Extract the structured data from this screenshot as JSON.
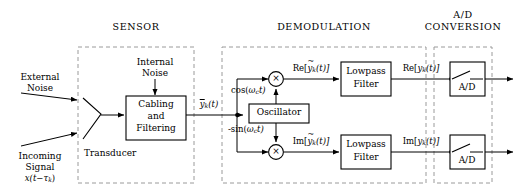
{
  "diagram": {
    "sections": [
      {
        "id": "sensor",
        "label": "SENSOR"
      },
      {
        "id": "demodulation",
        "label": "DEMODULATION"
      },
      {
        "id": "ad_conversion",
        "label": "A/D\nCONVERSION",
        "label_line1": "A/D",
        "label_line2": "CONVERSION"
      }
    ],
    "inputs": {
      "external_noise_line1": "External",
      "external_noise_line2": "Noise",
      "incoming_signal_line1": "Incoming",
      "incoming_signal_line2": "Signal",
      "incoming_signal_math_prefix": "x(t",
      "incoming_signal_math_minus": "−",
      "incoming_signal_math_tau": "τ",
      "incoming_signal_math_sub": "k",
      "incoming_signal_math_suffix": ")",
      "internal_noise_line1": "Internal",
      "internal_noise_line2": "Noise"
    },
    "blocks": {
      "transducer_label": "Transducer",
      "cabling_line1": "Cabling",
      "cabling_line2": "and",
      "cabling_line3": "Filtering",
      "oscillator_label": "Oscillator",
      "lowpass_line1": "Lowpass",
      "lowpass_line2": "Filter",
      "ad_label": "A/D",
      "multiplier_glyph": "×"
    },
    "signals": {
      "sensor_out_base": "y",
      "sensor_out_sub": "k",
      "sensor_out_suffix": "(t)",
      "cos_label_prefix": "cos(",
      "cos_label_omega": "ω",
      "cos_label_sub": "c",
      "cos_label_suffix": "t)",
      "sin_label_prefix": "-sin(",
      "sin_label_omega": "ω",
      "sin_label_sub": "c",
      "sin_label_suffix": "t)",
      "re_tilde_prefix": "Re[",
      "re_tilde_base": "y",
      "re_tilde_sub": "k",
      "re_tilde_suffix": "(t)]",
      "im_tilde_prefix": "Im[",
      "im_tilde_base": "y",
      "im_tilde_sub": "k",
      "im_tilde_suffix": "(t)]",
      "re_out_prefix": "Re[",
      "re_out_base": "y",
      "re_out_sub": "k",
      "re_out_suffix": "(t)]",
      "im_out_prefix": "Im[",
      "im_out_base": "y",
      "im_out_sub": "k",
      "im_out_suffix": "(t)]",
      "tilde_glyph": "~"
    },
    "colors": {
      "stroke": "#000000",
      "dashed_box": "#9a9a9a",
      "background": "#ffffff"
    }
  }
}
